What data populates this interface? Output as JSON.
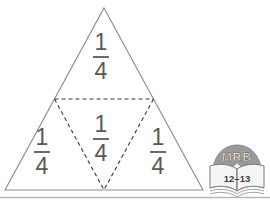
{
  "figure": {
    "name": "triangle-quarters-diagram",
    "shape": "equilateral-triangle",
    "outline_color": "#8b8b8d",
    "partition_line_style": "dashed",
    "partition_line_color": "#3a3a3c",
    "label_color": "#58585a",
    "baseline_color": "#aeaeb0",
    "parts": [
      {
        "id": "top",
        "position": "top",
        "numerator": "1",
        "denominator": "4"
      },
      {
        "id": "left",
        "position": "bottom-left",
        "numerator": "1",
        "denominator": "4"
      },
      {
        "id": "middle",
        "position": "center-inverted",
        "numerator": "1",
        "denominator": "4"
      },
      {
        "id": "right",
        "position": "bottom-right",
        "numerator": "1",
        "denominator": "4"
      }
    ]
  },
  "badge": {
    "name": "mrb-book-badge",
    "title": "MRB",
    "pages": "12–13",
    "dome_color": "#9a9a9c",
    "book_color": "#f2f2f2",
    "title_color": "#f4f4f4",
    "pages_color": "#3f3f41"
  }
}
